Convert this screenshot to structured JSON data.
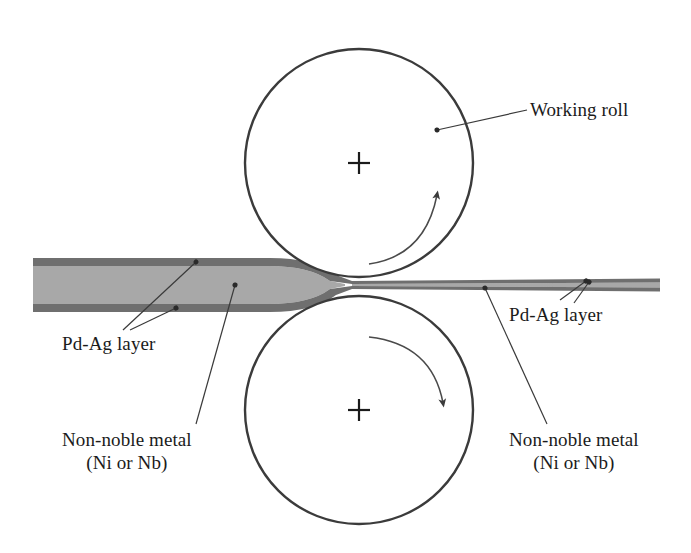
{
  "figure": {
    "background_color": "#ffffff",
    "line_color": "#3b3b3b",
    "text_color": "#1b1b1b"
  },
  "labels": {
    "working_roll": "Working roll",
    "pdag_layer_left": "Pd-Ag layer",
    "pdag_layer_right": "Pd-Ag layer",
    "non_noble_metal_left_line1": "Non-noble metal",
    "non_noble_metal_left_line2": "(Ni or Nb)",
    "non_noble_metal_right_line1": "Non-noble metal",
    "non_noble_metal_right_line2": "(Ni or Nb)"
  },
  "rolls": {
    "upper": {
      "name": "upper-working-roll",
      "center_x": 359,
      "center_y": 163,
      "radius": 114,
      "center_mark": "plus",
      "rotation": "clockwise"
    },
    "lower": {
      "name": "lower-working-roll",
      "center_x": 359,
      "center_y": 410,
      "radius": 114,
      "center_mark": "plus",
      "rotation": "clockwise"
    }
  },
  "strip": {
    "entry": {
      "name": "incoming-thick-strip",
      "x_start": 33,
      "x_end": 312,
      "top_y": 258,
      "bottom_y": 312,
      "clad_color": "#6f6f6f",
      "core_color": "#a8a8a8",
      "clad_thickness": 8
    },
    "exit": {
      "name": "outgoing-rolled-strip",
      "x_start": 400,
      "x_end": 660,
      "top_y": 278,
      "bottom_y": 292,
      "clad_color": "#6f6f6f",
      "core_color": "#a8a8a8",
      "clad_thickness": 3
    }
  },
  "colors": {
    "pdag_layer": "#6f6f6f",
    "non_noble_core": "#a8a8a8",
    "outline": "#3b3b3b"
  }
}
